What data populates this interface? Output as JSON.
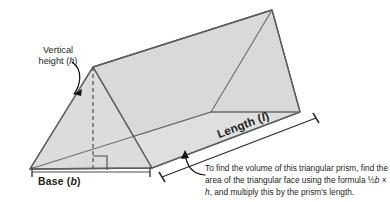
{
  "diagram": {
    "labels": {
      "vertical_height": "Vertical\nheight (h)",
      "vertical_height_text": "Vertical",
      "vertical_height_text2": "height (",
      "vertical_height_var": "h",
      "base": "Base (",
      "base_var": "b",
      "base_close": ")",
      "length": "Length (",
      "length_var": "l",
      "length_close": ")"
    },
    "caption": {
      "line1": "To find the volume of this triangular prism, find",
      "line2": "the area of the triangular face using the formula",
      "line3_pre": "½",
      "line3_b": "b",
      "line3_mid": " × ",
      "line3_h": "h",
      "line3_post": ", and multiply this by the prism's length."
    },
    "colors": {
      "face_fill": "#dddddd",
      "top_fill": "#e4e4e4",
      "side_fill": "#d6d6d6",
      "stroke": "#5a5a5a",
      "text": "#231f20",
      "background": "#ffffff",
      "arrow": "#1a1a1a"
    },
    "geometry": {
      "near_triangle": {
        "left_base": [
          30,
          169
        ],
        "apex": [
          93,
          67
        ],
        "right_base": [
          152,
          168
        ]
      },
      "far_triangle": {
        "left_base": [
          211,
          112
        ],
        "apex": [
          272,
          10
        ],
        "right_base": [
          300,
          112
        ]
      },
      "height_line": {
        "from": [
          93,
          67
        ],
        "to": [
          93,
          169
        ],
        "style": "dashed"
      },
      "right_angle_marker": {
        "at": [
          93,
          169
        ],
        "size": 13
      },
      "base_dimension": {
        "from": [
          30,
          172
        ],
        "to": [
          152,
          172
        ]
      },
      "length_dimension": {
        "from": [
          160,
          176
        ],
        "to": [
          317,
          117
        ]
      }
    },
    "annotations": {
      "height_arrow": "curved-arrow-pointing-to-height-line",
      "caption_arrow": "curved-arrow-pointing-to-prism"
    }
  }
}
